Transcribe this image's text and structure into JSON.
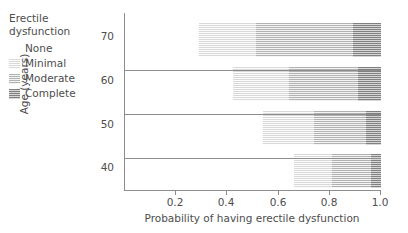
{
  "legend": {
    "title_lines": [
      "Erectile",
      "dysfunction"
    ],
    "items": [
      {
        "label": "None",
        "key": "none",
        "color": "#ffffff"
      },
      {
        "label": "Minimal",
        "key": "minimal",
        "color": "#f2f2f2"
      },
      {
        "label": "Moderate",
        "key": "moderate",
        "color": "#d3d3d3"
      },
      {
        "label": "Complete",
        "key": "complete",
        "color": "#a8a8a8"
      }
    ]
  },
  "axes": {
    "x_title": "Probability of having erectile dysfunction",
    "y_title": "Age (years)",
    "x_ticks": [
      "0.2",
      "0.4",
      "0.6",
      "0.8",
      "1.0"
    ],
    "y_ticks": [
      "70",
      "60",
      "50",
      "40"
    ]
  },
  "chart_data": {
    "type": "bar",
    "orientation": "horizontal",
    "stacked": true,
    "normalized": true,
    "title": "",
    "xlabel": "Probability of having erectile dysfunction",
    "ylabel": "Age (years)",
    "xlim": [
      0,
      1
    ],
    "xtick_values": [
      0.2,
      0.4,
      0.6,
      0.8,
      1.0
    ],
    "grid": false,
    "legend_position": "top-left-outside",
    "categories": [
      "70",
      "60",
      "50",
      "40"
    ],
    "series": [
      {
        "name": "None",
        "values": [
          0.29,
          0.42,
          0.54,
          0.66
        ]
      },
      {
        "name": "Minimal",
        "values": [
          0.22,
          0.22,
          0.2,
          0.15
        ]
      },
      {
        "name": "Moderate",
        "values": [
          0.38,
          0.27,
          0.2,
          0.15
        ]
      },
      {
        "name": "Complete",
        "values": [
          0.11,
          0.09,
          0.06,
          0.04
        ]
      }
    ],
    "cumulative_boundaries": {
      "70": [
        0.29,
        0.51,
        0.89,
        1.0
      ],
      "60": [
        0.42,
        0.64,
        0.91,
        1.0
      ],
      "50": [
        0.54,
        0.74,
        0.94,
        1.0
      ],
      "40": [
        0.66,
        0.81,
        0.96,
        1.0
      ]
    }
  }
}
